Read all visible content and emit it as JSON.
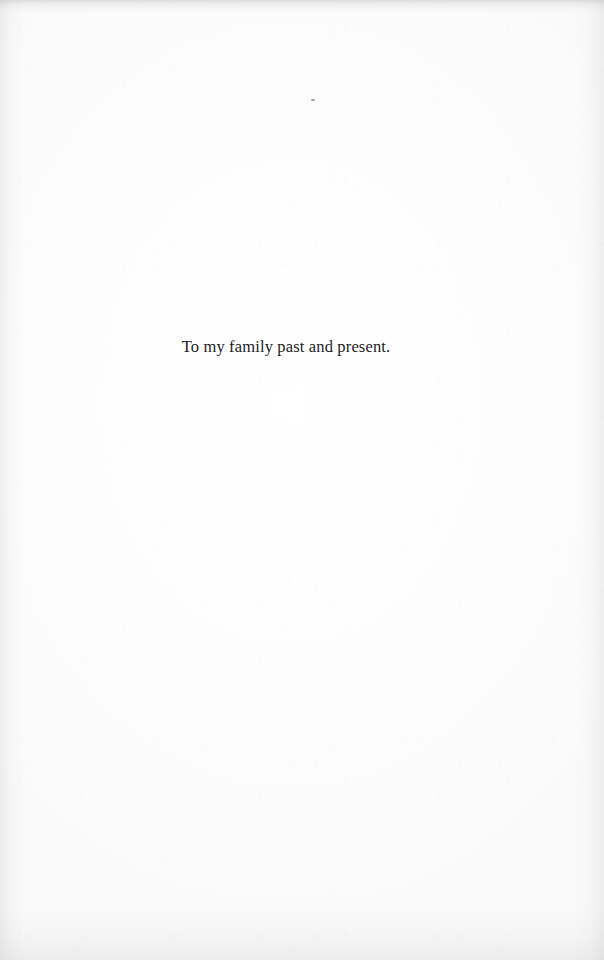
{
  "page": {
    "background_color": "#fdfdfd",
    "width": 604,
    "height": 960
  },
  "content": {
    "dedication_text": "To my family past and present."
  },
  "artifacts": {
    "speck_color": "#5a5a5f",
    "edge_shadow_color": "#a5a5a5"
  }
}
